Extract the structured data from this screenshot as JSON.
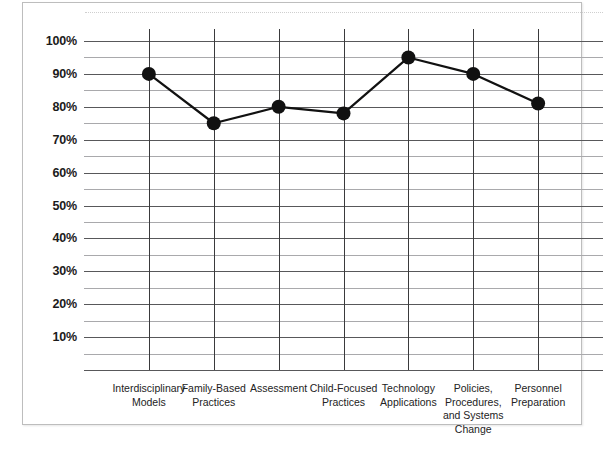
{
  "chart_data": {
    "type": "line",
    "title": "",
    "subtitle": "",
    "xlabel": "",
    "ylabel": "",
    "categories": [
      "Interdisciplinary Models",
      "Family-Based Practices",
      "Assessment",
      "Child-Focused Practices",
      "Technology Applications",
      "Policies, Procedures, and Systems Change",
      "Personnel Preparation"
    ],
    "category_lines": [
      [
        "Interdisciplinary",
        "Models"
      ],
      [
        "Family-Based",
        "Practices"
      ],
      [
        "Assessment"
      ],
      [
        "Child-Focused",
        "Practices"
      ],
      [
        "Technology",
        "Applications"
      ],
      [
        "Policies,",
        "Procedures,",
        "and Systems",
        "Change"
      ],
      [
        "Personnel",
        "Preparation"
      ]
    ],
    "values": [
      90,
      75,
      80,
      78,
      95,
      90,
      81
    ],
    "value_labels": [
      "90%",
      "75%",
      "80%",
      "78%",
      "95%",
      "90%",
      "81%"
    ],
    "ylim": [
      0,
      100
    ],
    "ytick_values": [
      100,
      90,
      80,
      70,
      60,
      50,
      40,
      30,
      20,
      10
    ],
    "ytick_labels": [
      "100%",
      "90%",
      "80%",
      "70%",
      "60%",
      "50%",
      "40%",
      "30%",
      "20%",
      "10%"
    ],
    "yminor_values": [
      95,
      85,
      75,
      65,
      55,
      45,
      35,
      25,
      15,
      5
    ],
    "grid": true,
    "grid_major_color": "#58585a",
    "grid_minor_color": "#a9a9ac",
    "legend": "none",
    "marker": "filled-circle",
    "marker_color": "#111111",
    "line_color": "#111111",
    "axis_color": "#3a3a3c",
    "background_color": "#ffffff",
    "frame_border_color": "#bdbdbd"
  }
}
